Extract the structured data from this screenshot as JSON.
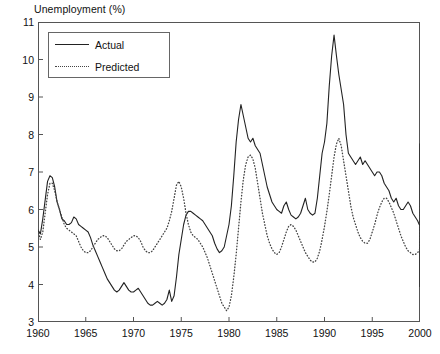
{
  "figure": {
    "ylabel": "Unemployment (%)",
    "background": "#ffffff",
    "frame_color": "#555555"
  },
  "legend": {
    "position": "top-left-inside",
    "entries": [
      {
        "label": "Actual",
        "style": "solid",
        "color": "#222222",
        "key_icon": "solid-line-icon"
      },
      {
        "label": "Predicted",
        "style": "dotted",
        "color": "#444444",
        "key_icon": "dotted-line-icon"
      }
    ]
  },
  "axes": {
    "y_ticks": [
      "3",
      "4",
      "5",
      "6",
      "7",
      "8",
      "9",
      "10",
      "11"
    ],
    "x_ticks": [
      "1960",
      "1965",
      "1970",
      "1975",
      "1980",
      "1985",
      "1990",
      "1995",
      "2000"
    ]
  },
  "chart_data": {
    "type": "line",
    "title": "",
    "subtitle": "",
    "xlabel": "",
    "ylabel": "Unemployment (%)",
    "xlim": [
      1960,
      2000
    ],
    "ylim": [
      3,
      11
    ],
    "x_tick_values": [
      1960,
      1965,
      1970,
      1975,
      1980,
      1985,
      1990,
      1995,
      2000
    ],
    "y_tick_values": [
      3,
      4,
      5,
      6,
      7,
      8,
      9,
      10,
      11
    ],
    "grid": false,
    "legend_position": "upper left",
    "x_step": 0.25,
    "annotations": [],
    "series": [
      {
        "name": "Actual",
        "style": "solid",
        "color": "#222222",
        "x_start": 1960.0,
        "values": [
          5.45,
          5.35,
          5.75,
          6.25,
          6.75,
          6.9,
          6.85,
          6.6,
          6.2,
          6.0,
          5.75,
          5.7,
          5.6,
          5.6,
          5.65,
          5.8,
          5.75,
          5.6,
          5.55,
          5.5,
          5.45,
          5.4,
          5.25,
          5.05,
          4.9,
          4.75,
          4.6,
          4.45,
          4.3,
          4.15,
          4.05,
          3.95,
          3.85,
          3.8,
          3.85,
          3.95,
          4.05,
          3.95,
          3.85,
          3.8,
          3.8,
          3.85,
          3.9,
          3.8,
          3.7,
          3.6,
          3.5,
          3.45,
          3.45,
          3.5,
          3.55,
          3.5,
          3.45,
          3.5,
          3.6,
          3.85,
          3.55,
          3.7,
          4.2,
          4.8,
          5.2,
          5.6,
          5.85,
          5.95,
          5.95,
          5.9,
          5.85,
          5.8,
          5.75,
          5.7,
          5.6,
          5.5,
          5.4,
          5.3,
          5.1,
          4.95,
          4.85,
          4.9,
          5.0,
          5.3,
          5.6,
          6.1,
          6.9,
          7.8,
          8.4,
          8.8,
          8.5,
          8.2,
          7.9,
          7.8,
          7.9,
          7.7,
          7.6,
          7.5,
          7.2,
          6.9,
          6.6,
          6.4,
          6.2,
          6.1,
          6.0,
          5.95,
          5.9,
          6.1,
          6.2,
          6.0,
          5.85,
          5.8,
          5.75,
          5.8,
          5.9,
          6.1,
          6.3,
          6.0,
          5.9,
          5.85,
          5.9,
          6.3,
          6.9,
          7.5,
          7.8,
          8.3,
          9.3,
          10.1,
          10.65,
          10.1,
          9.6,
          9.2,
          8.8,
          8.0,
          7.5,
          7.4,
          7.3,
          7.2,
          7.3,
          7.4,
          7.2,
          7.3,
          7.2,
          7.1,
          7.0,
          6.9,
          7.0,
          7.0,
          6.9,
          6.7,
          6.6,
          6.5,
          6.3,
          6.2,
          6.3,
          6.1,
          6.0,
          6.0,
          6.1,
          6.2,
          6.1,
          5.9,
          5.8,
          5.7,
          5.55,
          5.4,
          5.3,
          5.25,
          5.3,
          5.25,
          5.2,
          5.25,
          5.4,
          5.5,
          5.6,
          5.7,
          6.0,
          6.5,
          6.9,
          7.2,
          7.4,
          7.3,
          7.4,
          7.6,
          7.75,
          7.6,
          7.5,
          7.3,
          7.2,
          7.05,
          6.9,
          6.8,
          6.7,
          6.6,
          6.55,
          6.4,
          6.2,
          6.1,
          6.0,
          5.9,
          5.8,
          5.7,
          5.6,
          5.55,
          5.5,
          5.45,
          5.4,
          5.3,
          5.2,
          5.1,
          5.0,
          4.95,
          4.9,
          4.85,
          4.8,
          4.7,
          4.6,
          4.55,
          4.5,
          4.45,
          4.4,
          4.35,
          4.3,
          4.25,
          4.2,
          4.1,
          4.05,
          4.0,
          4.0,
          4.05,
          4.1,
          4.0,
          3.95,
          3.95,
          4.0,
          4.0,
          4.0,
          4.0,
          4.0,
          4.0,
          4.0,
          4.0,
          4.0,
          4.0,
          4.0,
          4.0
        ]
      },
      {
        "name": "Predicted",
        "style": "dotted",
        "color": "#444444",
        "x_start": 1960.0,
        "values": [
          5.45,
          5.2,
          5.4,
          5.9,
          6.4,
          6.7,
          6.7,
          6.5,
          6.2,
          6.0,
          5.8,
          5.6,
          5.5,
          5.45,
          5.4,
          5.35,
          5.3,
          5.15,
          5.0,
          4.9,
          4.85,
          4.85,
          4.9,
          5.0,
          5.1,
          5.2,
          5.25,
          5.3,
          5.3,
          5.25,
          5.15,
          5.05,
          4.95,
          4.9,
          4.9,
          4.95,
          5.05,
          5.15,
          5.2,
          5.25,
          5.3,
          5.3,
          5.25,
          5.15,
          5.0,
          4.9,
          4.85,
          4.85,
          4.9,
          5.0,
          5.1,
          5.2,
          5.3,
          5.4,
          5.5,
          5.7,
          5.95,
          6.3,
          6.65,
          6.75,
          6.6,
          6.3,
          5.9,
          5.6,
          5.4,
          5.3,
          5.25,
          5.2,
          5.1,
          5.0,
          4.85,
          4.7,
          4.5,
          4.3,
          4.1,
          3.9,
          3.7,
          3.5,
          3.4,
          3.3,
          3.4,
          3.7,
          4.2,
          4.8,
          5.5,
          6.2,
          6.8,
          7.2,
          7.4,
          7.45,
          7.35,
          7.1,
          6.7,
          6.3,
          5.9,
          5.6,
          5.3,
          5.1,
          4.95,
          4.85,
          4.8,
          4.85,
          5.0,
          5.2,
          5.4,
          5.55,
          5.6,
          5.55,
          5.45,
          5.3,
          5.15,
          5.0,
          4.85,
          4.75,
          4.65,
          4.6,
          4.6,
          4.7,
          4.9,
          5.2,
          5.55,
          5.95,
          6.4,
          6.9,
          7.4,
          7.75,
          7.9,
          7.7,
          7.3,
          6.9,
          6.5,
          6.1,
          5.8,
          5.6,
          5.4,
          5.25,
          5.15,
          5.1,
          5.1,
          5.2,
          5.4,
          5.6,
          5.85,
          6.05,
          6.2,
          6.3,
          6.3,
          6.2,
          6.05,
          5.9,
          5.7,
          5.5,
          5.3,
          5.15,
          5.0,
          4.9,
          4.85,
          4.8,
          4.8,
          4.85,
          4.95,
          5.1,
          5.35,
          5.6,
          5.85,
          6.0,
          6.15,
          6.2,
          6.2,
          6.15,
          6.2,
          6.2,
          6.25,
          6.3,
          6.35,
          6.35,
          6.3,
          6.25,
          6.3,
          6.4,
          6.5,
          6.6,
          6.7,
          6.7,
          6.6,
          6.45,
          6.3,
          6.1,
          5.95,
          5.85,
          5.8,
          5.8,
          5.9,
          6.0,
          6.1,
          6.2,
          6.3,
          6.4,
          6.5,
          6.55,
          6.5,
          6.45,
          6.5,
          6.55,
          6.6,
          6.6,
          6.55,
          6.5,
          6.55,
          6.6,
          6.65,
          6.6,
          6.55,
          6.5,
          6.4,
          6.35,
          6.3,
          6.2,
          6.15,
          6.2,
          6.25,
          6.2,
          6.1,
          6.0,
          5.95,
          5.9,
          5.85,
          5.8,
          5.75,
          5.7,
          5.65,
          5.6,
          5.6,
          5.55,
          5.55,
          5.5,
          5.5,
          5.5,
          5.5,
          5.5,
          5.5,
          5.5
        ]
      }
    ]
  }
}
